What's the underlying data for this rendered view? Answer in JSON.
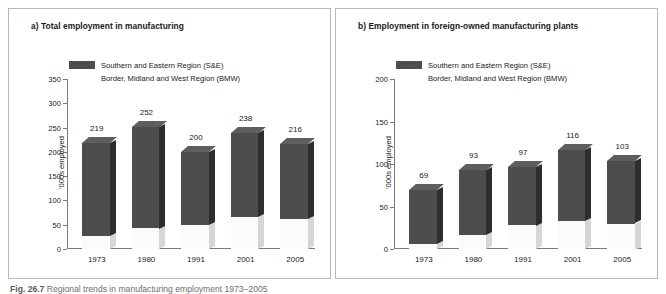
{
  "figure": {
    "caption_number": "Fig. 26.7",
    "caption_text": "Regional trends in manufacturing employment 1973–2005"
  },
  "legend": {
    "series": [
      {
        "label": "Southern and Eastern Region (S&E)",
        "color": "#4d4d4d",
        "key": "se"
      },
      {
        "label": "Border, Midland and West Region (BMW)",
        "color": "#fbfbfb",
        "key": "bmw"
      }
    ]
  },
  "panels": [
    {
      "id": "panel-a",
      "title": "a) Total employment in manufacturing",
      "ylabel": "'000s employed"
    },
    {
      "id": "panel-b",
      "title": "b) Employment in foreign-owned manufacturing plants",
      "ylabel": "'000s employed"
    }
  ],
  "chart_data": [
    {
      "type": "bar",
      "id": "panel-a",
      "title": "a) Total employment in manufacturing",
      "xlabel": "",
      "ylabel": "'000s employed",
      "categories": [
        "1973",
        "1980",
        "1991",
        "2001",
        "2005"
      ],
      "ylim": [
        0,
        350
      ],
      "yticks": [
        0,
        50,
        100,
        150,
        200,
        250,
        300,
        350
      ],
      "ytick_labels": [
        "0",
        "50",
        "100",
        "150",
        "200",
        "250",
        "300",
        "350"
      ],
      "grid": false,
      "stacked": true,
      "legend_position": "top-center",
      "series": [
        {
          "name": "Border, Midland and West Region (BMW)",
          "values": [
            27,
            43,
            49,
            65,
            61
          ]
        },
        {
          "name": "Southern and Eastern Region (S&E)",
          "values": [
            192,
            209,
            151,
            173,
            155
          ]
        }
      ],
      "totals": [
        219,
        252,
        200,
        238,
        216
      ],
      "data_labels": [
        "219",
        "252",
        "200",
        "238",
        "216"
      ]
    },
    {
      "type": "bar",
      "id": "panel-b",
      "title": "b) Employment in foreign-owned manufacturing plants",
      "xlabel": "",
      "ylabel": "'000s employed",
      "categories": [
        "1973",
        "1980",
        "1991",
        "2001",
        "2005"
      ],
      "ylim": [
        0,
        200
      ],
      "yticks": [
        0,
        50,
        100,
        150,
        200
      ],
      "ytick_labels": [
        "0",
        "50",
        "100",
        "150",
        "200"
      ],
      "grid": false,
      "stacked": true,
      "legend_position": "top-center",
      "series": [
        {
          "name": "Border, Midland and West Region (BMW)",
          "values": [
            6,
            17,
            28,
            33,
            30
          ]
        },
        {
          "name": "Southern and Eastern Region (S&E)",
          "values": [
            63,
            76,
            69,
            83,
            73
          ]
        }
      ],
      "totals": [
        69,
        93,
        97,
        116,
        103
      ],
      "data_labels": [
        "69",
        "93",
        "97",
        "116",
        "103"
      ]
    }
  ]
}
